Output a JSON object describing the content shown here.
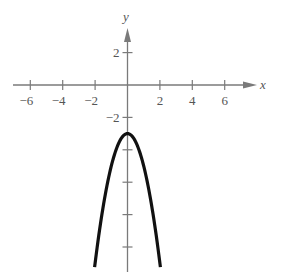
{
  "chart_data": {
    "type": "line",
    "title": "",
    "xlabel": "x",
    "ylabel": "y",
    "x_ticks": [
      -6,
      -4,
      -2,
      2,
      4,
      6
    ],
    "x_tick_labels": [
      "−6",
      "−4",
      "−2",
      "2",
      "4",
      "6"
    ],
    "y_ticks": [
      2,
      -2,
      -4,
      -6,
      -8,
      -10
    ],
    "y_tick_labels": [
      "2",
      "−2"
    ],
    "xlim": [
      -7,
      8
    ],
    "ylim": [
      -11.2,
      4
    ],
    "grid": false,
    "series": [
      {
        "name": "y = -2x^2 - 3",
        "equation": "y = -2x^2 - 3",
        "x": [
          -2,
          -1.5,
          -1,
          -0.5,
          0,
          0.5,
          1,
          1.5,
          2
        ],
        "values": [
          -11,
          -7.5,
          -5,
          -3.5,
          -3,
          -3.5,
          -5,
          -7.5,
          -11
        ]
      }
    ]
  },
  "style": {
    "axis_color": "#7a7a7a",
    "curve_color": "#111111"
  }
}
